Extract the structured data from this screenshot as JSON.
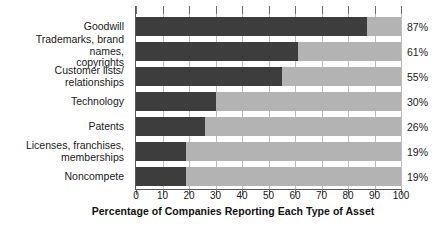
{
  "chart_data": {
    "type": "bar",
    "orientation": "horizontal",
    "title": "",
    "xlabel": "Percentage of Companies Reporting Each Type of Asset",
    "ylabel": "",
    "xlim": [
      0,
      100
    ],
    "xticks": [
      0,
      10,
      20,
      30,
      40,
      50,
      60,
      70,
      80,
      90,
      100
    ],
    "grid": true,
    "legend": false,
    "categories": [
      "Goodwill",
      "Trademarks, brand names,\ncopyrights",
      "Customer lists/\nrelationships",
      "Technology",
      "Patents",
      "Licenses, franchises,\nmemberships",
      "Noncompete"
    ],
    "values": [
      87,
      61,
      55,
      30,
      26,
      19,
      19
    ],
    "value_labels": [
      "87%",
      "61%",
      "55%",
      "30%",
      "26%",
      "19%",
      "19%"
    ],
    "colors": {
      "bar_fill": "#3d3d3d",
      "bar_track": "#b3b3b3",
      "gridline": "#bdbdbd",
      "axis": "#5a5a5a",
      "text": "#1a1a1a",
      "background": "#ffffff"
    }
  }
}
